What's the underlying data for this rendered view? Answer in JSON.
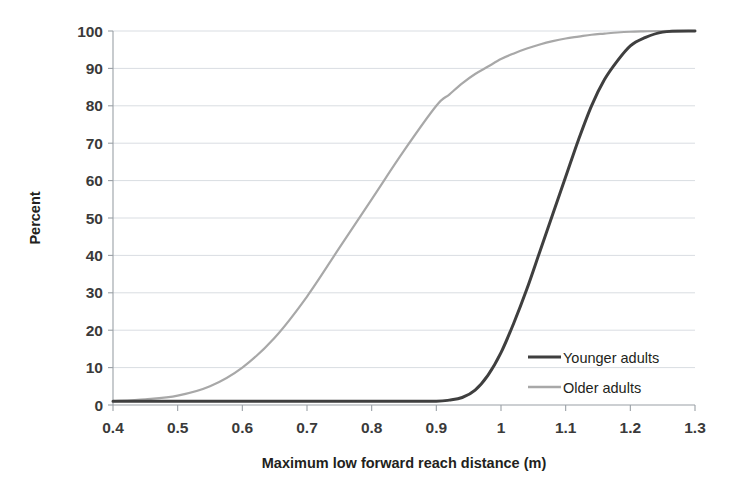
{
  "chart_data": {
    "type": "line",
    "title": "",
    "subtitle": "",
    "xlabel": "Maximum low forward reach distance (m)",
    "ylabel": "Percent",
    "xlim": [
      0.4,
      1.3
    ],
    "ylim": [
      0,
      100
    ],
    "grid": "horizontal",
    "legend_position": "inside-bottom-right",
    "x_ticks": [
      "0.4",
      "0.5",
      "0.6",
      "0.7",
      "0.8",
      "0.9",
      "1",
      "1.1",
      "1.2",
      "1.3"
    ],
    "x_tick_values": [
      0.4,
      0.5,
      0.6,
      0.7,
      0.8,
      0.9,
      1.0,
      1.1,
      1.2,
      1.3
    ],
    "y_ticks": [
      "0",
      "10",
      "20",
      "30",
      "40",
      "50",
      "60",
      "70",
      "80",
      "90",
      "100"
    ],
    "y_tick_values": [
      0,
      10,
      20,
      30,
      40,
      50,
      60,
      70,
      80,
      90,
      100
    ],
    "x": [
      0.4,
      0.45,
      0.5,
      0.55,
      0.6,
      0.65,
      0.7,
      0.75,
      0.8,
      0.85,
      0.9,
      0.92,
      0.94,
      0.96,
      0.98,
      1.0,
      1.02,
      1.04,
      1.06,
      1.08,
      1.1,
      1.12,
      1.14,
      1.16,
      1.18,
      1.2,
      1.22,
      1.25,
      1.3
    ],
    "series": [
      {
        "name": "Younger adults",
        "color": "#3f3f3f",
        "width": 3.0,
        "values": [
          1,
          1,
          1,
          1,
          1,
          1,
          1,
          1,
          1,
          1,
          1,
          1.3,
          2,
          4,
          8,
          14,
          22,
          31,
          41,
          51,
          61,
          71,
          80,
          87,
          92,
          96,
          98,
          99.7,
          100
        ]
      },
      {
        "name": "Older adults",
        "color": "#a8a8a8",
        "width": 2.2,
        "values": [
          1,
          1.5,
          2.5,
          5,
          10,
          18,
          29,
          42,
          55,
          68,
          80,
          83,
          86,
          88.5,
          90.5,
          92.5,
          94,
          95.3,
          96.4,
          97.3,
          98,
          98.5,
          99,
          99.3,
          99.6,
          99.8,
          99.9,
          100,
          100
        ]
      }
    ],
    "annotations": []
  },
  "legend": {
    "items": [
      {
        "label": "Younger adults",
        "color": "#3f3f3f"
      },
      {
        "label": "Older adults",
        "color": "#a8a8a8"
      }
    ]
  },
  "style": {
    "background": "#ffffff",
    "grid_color": "#d9dde2",
    "axis_color": "#9aa0a6",
    "text_color": "#231f20"
  }
}
